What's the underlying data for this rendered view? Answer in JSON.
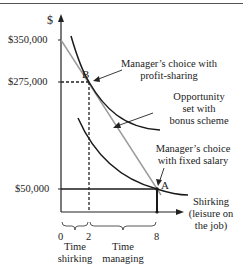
{
  "axes": {
    "y_label": "$",
    "y_ticks": [
      "$350,000",
      "$275,000",
      "$50,000"
    ],
    "x_ticks": [
      "0",
      "2",
      "8"
    ],
    "x_label_lines": [
      "Shirking",
      "(leisure on",
      "the job)"
    ]
  },
  "points": {
    "B": "B",
    "A": "A"
  },
  "annotations": {
    "profit_sharing": [
      "Manager’s choice with",
      "profit-sharing"
    ],
    "bonus_scheme": [
      "Opportunity",
      "set with",
      "bonus scheme"
    ],
    "fixed_salary": [
      "Manager’s choice",
      "with fixed salary"
    ]
  },
  "brackets": {
    "shirking": [
      "Time",
      "shirking"
    ],
    "managing": [
      "Time",
      "managing"
    ]
  },
  "colors": {
    "curve": "#1a1a1a",
    "budget_line": "#9a9a9a",
    "text": "#222222"
  }
}
